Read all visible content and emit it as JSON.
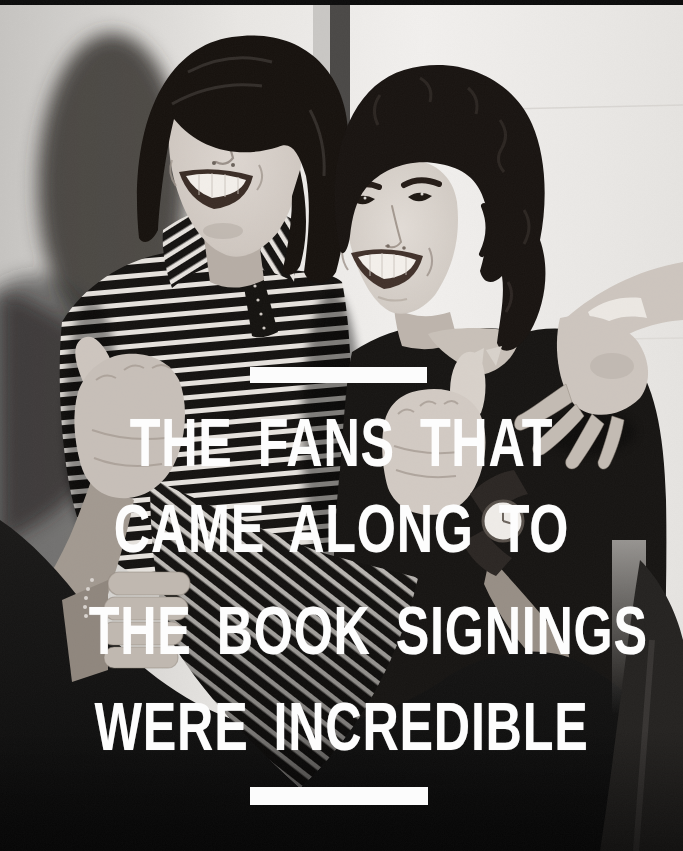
{
  "image": {
    "alt": "Black-and-white photograph of two smiling young men, one in a striped shirt and one in a dark t-shirt, giving thumbs-up gestures"
  },
  "quote": {
    "lines": [
      "THE FANS THAT",
      "CAME ALONG TO",
      "THE BOOK SIGNINGS",
      "WERE INCREDIBLE"
    ],
    "text_color": "#ffffff",
    "divider_color": "#fcfcfc"
  }
}
